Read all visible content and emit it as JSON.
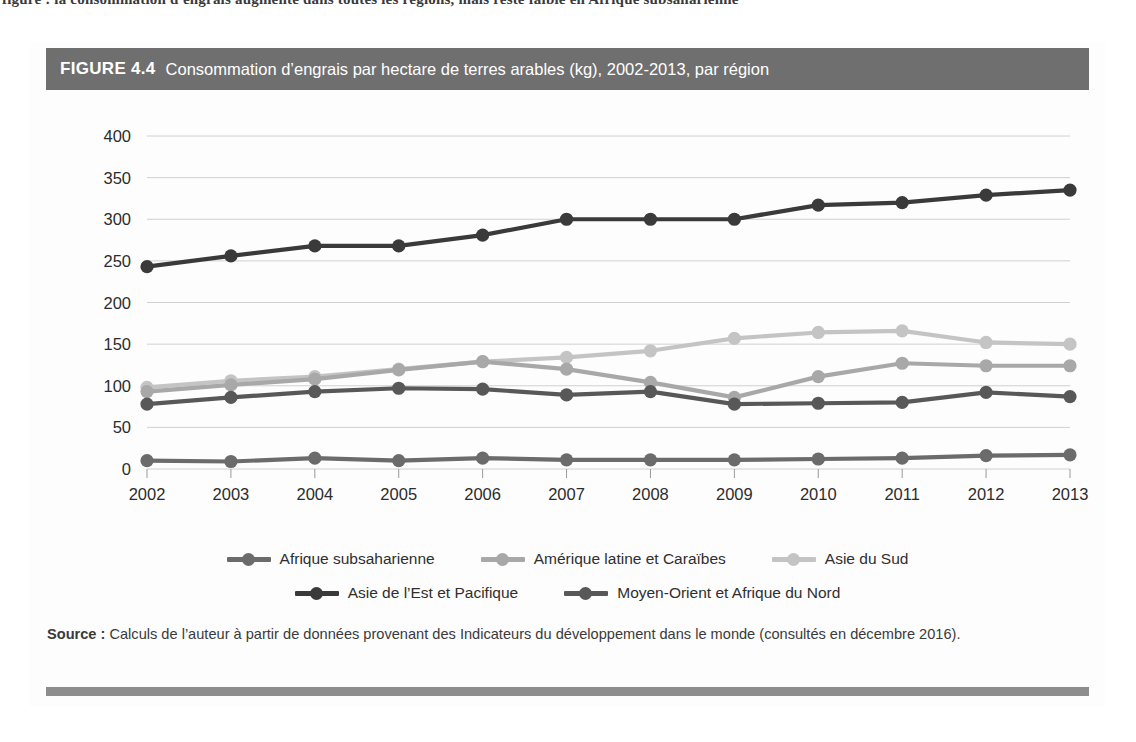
{
  "top_bleed_text": "figure : la consommation d'engrais augmente dans toutes les régions, mais reste faible en Afrique subsaharienne",
  "figure": {
    "label": "FIGURE 4.4",
    "title": "Consommation d’engrais par hectare de terres arables (kg), 2002-2013, par région",
    "header_bg": "#6f6f6f",
    "header_fg": "#ffffff",
    "bottom_rule_color": "#8d8d8d"
  },
  "source": {
    "label": "Source :",
    "text": " Calculs de l’auteur à partir de données provenant des Indicateurs du développement dans le monde (consultés en décembre 2016)."
  },
  "legend": {
    "rows": [
      [
        {
          "label": "Afrique subsaharienne",
          "color": "#6b6b6b"
        },
        {
          "label": "Amérique latine et Caraïbes",
          "color": "#a8a8a8"
        },
        {
          "label": "Asie du Sud",
          "color": "#c4c4c4"
        }
      ],
      [
        {
          "label": "Asie de l’Est et Pacifique",
          "color": "#3a3a3a"
        },
        {
          "label": "Moyen-Orient et Afrique du Nord",
          "color": "#585858"
        }
      ]
    ]
  },
  "axis": {
    "y_ticks": [
      "0",
      "50",
      "100",
      "150",
      "200",
      "250",
      "300",
      "350",
      "400"
    ],
    "x_ticks": [
      "2002",
      "2003",
      "2004",
      "2005",
      "2006",
      "2007",
      "2008",
      "2009",
      "2010",
      "2011",
      "2012",
      "2013"
    ],
    "grid": true,
    "gridline_color": "#d0d0d0"
  },
  "chart_data": {
    "type": "line",
    "title": "Consommation d’engrais par hectare de terres arables (kg), 2002-2013, par région",
    "xlabel": "",
    "ylabel": "",
    "ylim": [
      0,
      400
    ],
    "ytick_step": 50,
    "grid": true,
    "legend_position": "bottom",
    "x": [
      2002,
      2003,
      2004,
      2005,
      2006,
      2007,
      2008,
      2009,
      2010,
      2011,
      2012,
      2013
    ],
    "categories": [
      "2002",
      "2003",
      "2004",
      "2005",
      "2006",
      "2007",
      "2008",
      "2009",
      "2010",
      "2011",
      "2012",
      "2013"
    ],
    "series": [
      {
        "name": "Asie de l’Est et Pacifique",
        "color": "#3a3a3a",
        "values": [
          243,
          256,
          268,
          268,
          281,
          300,
          300,
          300,
          317,
          320,
          329,
          335
        ]
      },
      {
        "name": "Asie du Sud",
        "color": "#c4c4c4",
        "values": [
          98,
          106,
          111,
          120,
          129,
          134,
          142,
          157,
          164,
          166,
          152,
          150
        ]
      },
      {
        "name": "Amérique latine et Caraïbes",
        "color": "#a8a8a8",
        "values": [
          93,
          101,
          108,
          119,
          129,
          120,
          104,
          86,
          111,
          127,
          124,
          124
        ]
      },
      {
        "name": "Moyen-Orient et Afrique du Nord",
        "color": "#585858",
        "values": [
          78,
          86,
          93,
          97,
          96,
          89,
          93,
          78,
          79,
          80,
          92,
          87
        ]
      },
      {
        "name": "Afrique subsaharienne",
        "color": "#6b6b6b",
        "values": [
          10,
          9,
          13,
          10,
          13,
          11,
          11,
          11,
          12,
          13,
          16,
          17
        ]
      }
    ]
  }
}
